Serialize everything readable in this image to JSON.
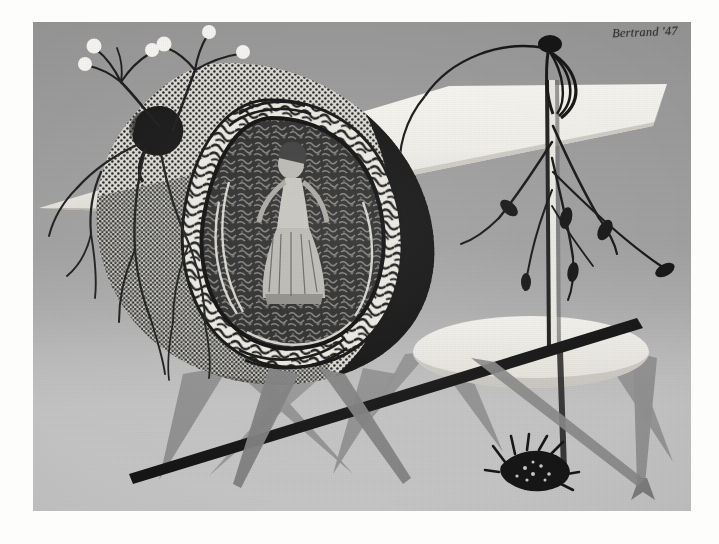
{
  "artwork": {
    "signature": "Bertrand '47",
    "year": "'47",
    "medium_tone": "grey halftone print",
    "title": "Surrealist Composition",
    "plate": {
      "x": 33,
      "y": 22,
      "width": 658,
      "height": 489
    },
    "canvas": {
      "width": 719,
      "height": 544
    }
  },
  "palette": {
    "paper": "#fdfdfc",
    "bg_top": "#959595",
    "bg_bottom": "#c6c6c6",
    "ink_black": "#1a1a1a",
    "mid_grey": "#7d7d7d",
    "leg_grey": "#8a8a8a",
    "plank_white": "#f2f1ec",
    "table_white": "#eeede7",
    "stipple_light": "#d9d8d2"
  },
  "elements": {
    "stippled_form": {
      "label": "Stippled triangular form",
      "note": "rounded triangular mass, dotted texture on left, solid black on right"
    },
    "ornate_frame": {
      "label": "Ornate rococo frame",
      "note": "scrollwork cartouche enclosing a figure"
    },
    "framed_figure": {
      "label": "Figure in dress",
      "note": "standing female figure among foliage"
    },
    "flower_stems": {
      "label": "Ball-tipped flower stems",
      "count": 2,
      "bloom_count": 6
    },
    "dark_blot": {
      "label": "Dark ink blot"
    },
    "root_tendrils": {
      "label": "Branching root tendrils"
    },
    "white_plank": {
      "label": "White plank slab"
    },
    "plank_knob": {
      "label": "Dark knob with ribbons"
    },
    "vertical_post": {
      "label": "Vertical post"
    },
    "bulb_tendrils": {
      "label": "Tendrils with bulb swellings",
      "bulb_count": 6
    },
    "oval_table": {
      "label": "Oval white tabletop"
    },
    "table_legs": {
      "label": "Tapering grey legs",
      "count": 4
    },
    "cross_legs": {
      "label": "Crossing tapered legs"
    },
    "dark_bar": {
      "label": "Dark diagonal bar"
    },
    "creature": {
      "label": "Spiky burr creature"
    }
  }
}
